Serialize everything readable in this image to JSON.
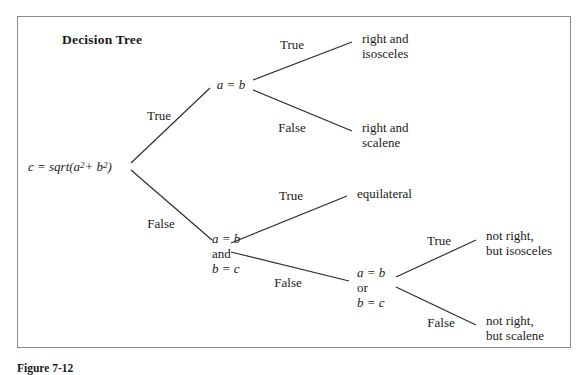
{
  "figure": {
    "title": "Decision Tree",
    "caption": "Figure 7-12"
  },
  "nodes": {
    "root": {
      "name": "root-condition",
      "prefix": "c = sqrt(a",
      "exp1": "2",
      "middle": "+ b",
      "exp2": "2",
      "suffix": ")",
      "full_text": "c = sqrt(a² + b²)"
    },
    "n1": {
      "name": "node-a-eq-b",
      "lines": [
        "a = b"
      ]
    },
    "n2": {
      "name": "node-a-eq-b-and-b-eq-c",
      "lines": [
        "a = b",
        "and",
        "b = c"
      ]
    },
    "n3": {
      "name": "node-a-eq-b-or-b-eq-c",
      "lines": [
        "a = b",
        "or",
        "b = c"
      ]
    }
  },
  "leaves": [
    {
      "id": "leaf-right-isosceles",
      "lines": [
        "right and",
        "isosceles"
      ]
    },
    {
      "id": "leaf-right-scalene",
      "lines": [
        "right and",
        "scalene"
      ]
    },
    {
      "id": "leaf-equilateral",
      "lines": [
        "equilateral"
      ]
    },
    {
      "id": "leaf-not-right-isosceles",
      "lines": [
        "not right,",
        "but isosceles"
      ]
    },
    {
      "id": "leaf-not-right-scalene",
      "lines": [
        "not right,",
        "but scalene"
      ]
    }
  ],
  "edge_labels": {
    "root_true": "True",
    "root_false": "False",
    "n1_true": "True",
    "n1_false": "False",
    "n2_true": "True",
    "n2_false": "False",
    "n3_true": "True",
    "n3_false": "False"
  },
  "colors": {
    "frame": "#8d8d8d",
    "edge": "#2b2b2b",
    "text": "#1a1a1a",
    "background": "#ffffff"
  }
}
